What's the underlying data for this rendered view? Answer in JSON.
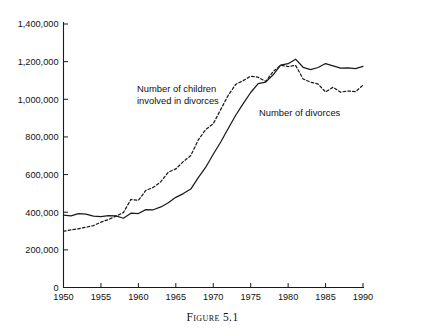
{
  "chart_data": {
    "type": "line",
    "title": "",
    "subtitle": "",
    "caption": "Figure 5.1",
    "xlabel": "",
    "ylabel": "",
    "xlim": [
      1950,
      1990
    ],
    "ylim": [
      0,
      1400000
    ],
    "grid": false,
    "legend_position": "inline-annotation",
    "x_tick_labels": [
      "1950",
      "1955",
      "1960",
      "1965",
      "1970",
      "1975",
      "1980",
      "1985",
      "1990"
    ],
    "x_ticks": [
      1950,
      1955,
      1960,
      1965,
      1970,
      1975,
      1980,
      1985,
      1990
    ],
    "y_tick_labels": [
      "0",
      "200,000",
      "400,000",
      "600,000",
      "800,000",
      "1,000,000",
      "1,200,000",
      "1,400,000"
    ],
    "y_ticks": [
      0,
      200000,
      400000,
      600000,
      800000,
      1000000,
      1200000,
      1400000
    ],
    "x": [
      1950,
      1951,
      1952,
      1953,
      1954,
      1955,
      1956,
      1957,
      1958,
      1959,
      1960,
      1961,
      1962,
      1963,
      1964,
      1965,
      1966,
      1967,
      1968,
      1969,
      1970,
      1971,
      1972,
      1973,
      1974,
      1975,
      1976,
      1977,
      1978,
      1979,
      1980,
      1981,
      1982,
      1983,
      1984,
      1985,
      1986,
      1987,
      1988,
      1989,
      1990
    ],
    "series": [
      {
        "name": "Number of divorces",
        "style": "solid",
        "color": "#1a1a1a",
        "label_text": "Number of divorces",
        "values": [
          385000,
          381000,
          392000,
          390000,
          379000,
          377000,
          382000,
          381000,
          368000,
          395000,
          393000,
          414000,
          413000,
          428000,
          450000,
          479000,
          499000,
          523000,
          584000,
          639000,
          708000,
          773000,
          845000,
          915000,
          977000,
          1036000,
          1083000,
          1091000,
          1130000,
          1181000,
          1189000,
          1213000,
          1170000,
          1158000,
          1169000,
          1190000,
          1178000,
          1166000,
          1167000,
          1163000,
          1175000
        ]
      },
      {
        "name": "Number of children involved in divorces",
        "style": "dashed",
        "color": "#1a1a1a",
        "label_text": "Number of children involved in divorces",
        "values": [
          299000,
          306000,
          312000,
          320000,
          329000,
          347000,
          361000,
          379000,
          398000,
          468000,
          463000,
          516000,
          532000,
          562000,
          613000,
          630000,
          669000,
          701000,
          784000,
          840000,
          870000,
          946000,
          1021000,
          1079000,
          1099000,
          1123000,
          1117000,
          1095000,
          1147000,
          1181000,
          1174000,
          1180000,
          1108000,
          1091000,
          1081000,
          1039000,
          1064000,
          1038000,
          1044000,
          1040000,
          1075000
        ]
      }
    ],
    "annotations": [
      {
        "name": "children-label",
        "line1": "Number of children",
        "line2": "involved in divorces",
        "x_px": 137,
        "y_px": 92
      },
      {
        "name": "divorces-label",
        "line1": "Number of divorces",
        "line2": "",
        "x_px": 259,
        "y_px": 116
      }
    ]
  },
  "figure": {
    "caption": "Figure 5.1"
  }
}
